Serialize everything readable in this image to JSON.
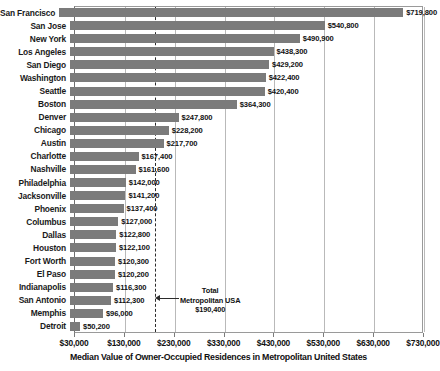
{
  "chart_data": {
    "type": "bar",
    "orientation": "horizontal",
    "title": "",
    "xlabel": "Median Value of Owner-Occupied Residences in Metropolitan United States",
    "ylabel": "",
    "xlim": [
      30000,
      730000
    ],
    "xticks": [
      "$30,000",
      "$130,000",
      "$230,000",
      "$330,000",
      "$430,000",
      "$530,000",
      "$630,000",
      "$730,000"
    ],
    "xtick_values": [
      30000,
      130000,
      230000,
      330000,
      430000,
      530000,
      630000,
      730000
    ],
    "grid": true,
    "legend": "none",
    "bar_color": "#7b7b7b",
    "categories": [
      "San Francisco",
      "San Jose",
      "New York",
      "Los Angeles",
      "San Diego",
      "Washington",
      "Seattle",
      "Boston",
      "Denver",
      "Chicago",
      "Austin",
      "Charlotte",
      "Nashville",
      "Philadelphia",
      "Jacksonville",
      "Phoenix",
      "Columbus",
      "Dallas",
      "Houston",
      "Fort Worth",
      "El Paso",
      "Indianapolis",
      "San Antonio",
      "Memphis",
      "Detroit"
    ],
    "values": [
      719800,
      540800,
      490900,
      438300,
      429200,
      422400,
      420400,
      364300,
      247800,
      228200,
      217700,
      167400,
      161600,
      142000,
      141200,
      137400,
      127000,
      122800,
      122100,
      120300,
      120200,
      116300,
      112300,
      96000,
      50200
    ],
    "value_labels": [
      "$719,800",
      "$540,800",
      "$490,900",
      "$438,300",
      "$429,200",
      "$422,400",
      "$420,400",
      "$364,300",
      "$247,800",
      "$228,200",
      "$217,700",
      "$167,400",
      "$161,600",
      "$142,000",
      "$141,200",
      "$137,400",
      "$127,000",
      "$122,800",
      "$122,100",
      "$120,300",
      "$120,200",
      "$116,300",
      "$112,300",
      "$96,000",
      "$50,200"
    ],
    "annotations": [
      {
        "name": "total-metropolitan-usa",
        "line1": "Total",
        "line2": "Metropolitan USA",
        "line3": "$190,400",
        "value": 190400,
        "marker": "dashed-vertical-line",
        "arrow": "left"
      }
    ]
  }
}
